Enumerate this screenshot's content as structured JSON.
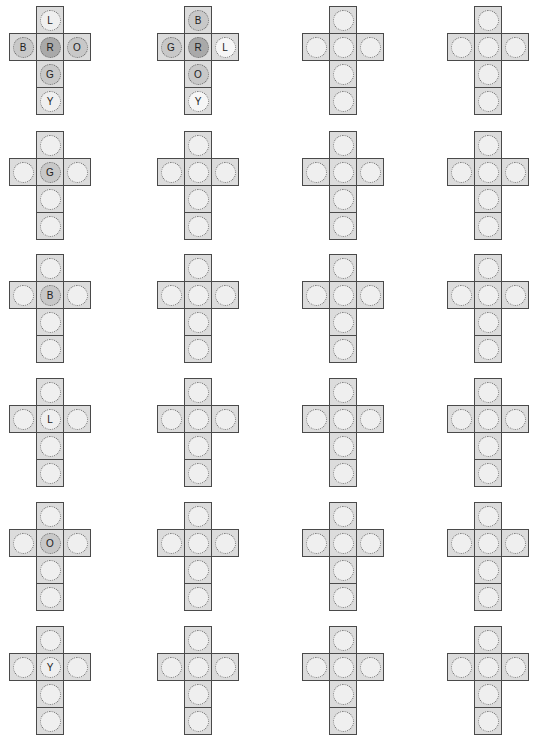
{
  "diagram": {
    "title": "",
    "type": "cube-net-grid",
    "layout": {
      "rows": 6,
      "columns": 4,
      "cell_size_px": 28
    },
    "shape_positions": {
      "cells": [
        {
          "key": "top",
          "col": 1,
          "row": 0
        },
        {
          "key": "left",
          "col": 0,
          "row": 1
        },
        {
          "key": "center",
          "col": 1,
          "row": 1
        },
        {
          "key": "right",
          "col": 2,
          "row": 1
        },
        {
          "key": "below",
          "col": 1,
          "row": 2
        },
        {
          "key": "bottom",
          "col": 1,
          "row": 3
        }
      ]
    },
    "colors": {
      "cell_fill": "#dcdcdc",
      "cell_border": "#4a4a4a",
      "circle_fill": "#efefef",
      "circle_shaded": "#a9a9a9",
      "circle_mid": "#c8c8c8"
    },
    "nets": [
      {
        "row": 0,
        "col": 0,
        "x": 9,
        "y": 6,
        "labels": {
          "top": "L",
          "left": "B",
          "center": "R",
          "right": "O",
          "below": "G",
          "bottom": "Y"
        },
        "shade": {
          "center": "dark",
          "left": "mid",
          "right": "mid",
          "below": "mid"
        }
      },
      {
        "row": 0,
        "col": 1,
        "x": 157,
        "y": 6,
        "labels": {
          "top": "B",
          "left": "G",
          "center": "R",
          "right": "L",
          "below": "O",
          "bottom": "Y"
        },
        "shade": {
          "center": "dark",
          "left": "mid",
          "top": "mid",
          "below": "mid",
          "right": "light",
          "bottom": "light"
        }
      },
      {
        "row": 0,
        "col": 2,
        "x": 302,
        "y": 6,
        "labels": {},
        "shade": {}
      },
      {
        "row": 0,
        "col": 3,
        "x": 447,
        "y": 6,
        "labels": {},
        "shade": {}
      },
      {
        "row": 1,
        "col": 0,
        "x": 9,
        "y": 131,
        "labels": {
          "center": "G"
        },
        "shade": {
          "center": "mid"
        }
      },
      {
        "row": 1,
        "col": 1,
        "x": 157,
        "y": 131,
        "labels": {},
        "shade": {}
      },
      {
        "row": 1,
        "col": 2,
        "x": 302,
        "y": 131,
        "labels": {},
        "shade": {}
      },
      {
        "row": 1,
        "col": 3,
        "x": 447,
        "y": 131,
        "labels": {},
        "shade": {}
      },
      {
        "row": 2,
        "col": 0,
        "x": 9,
        "y": 254,
        "labels": {
          "center": "B"
        },
        "shade": {
          "center": "mid"
        }
      },
      {
        "row": 2,
        "col": 1,
        "x": 157,
        "y": 254,
        "labels": {},
        "shade": {}
      },
      {
        "row": 2,
        "col": 2,
        "x": 302,
        "y": 254,
        "labels": {},
        "shade": {}
      },
      {
        "row": 2,
        "col": 3,
        "x": 447,
        "y": 254,
        "labels": {},
        "shade": {}
      },
      {
        "row": 3,
        "col": 0,
        "x": 9,
        "y": 378,
        "labels": {
          "center": "L"
        },
        "shade": {}
      },
      {
        "row": 3,
        "col": 1,
        "x": 157,
        "y": 378,
        "labels": {},
        "shade": {}
      },
      {
        "row": 3,
        "col": 2,
        "x": 302,
        "y": 378,
        "labels": {},
        "shade": {}
      },
      {
        "row": 3,
        "col": 3,
        "x": 447,
        "y": 378,
        "labels": {},
        "shade": {}
      },
      {
        "row": 4,
        "col": 0,
        "x": 9,
        "y": 502,
        "labels": {
          "center": "O"
        },
        "shade": {
          "center": "mid"
        }
      },
      {
        "row": 4,
        "col": 1,
        "x": 157,
        "y": 502,
        "labels": {},
        "shade": {}
      },
      {
        "row": 4,
        "col": 2,
        "x": 302,
        "y": 502,
        "labels": {},
        "shade": {}
      },
      {
        "row": 4,
        "col": 3,
        "x": 447,
        "y": 502,
        "labels": {},
        "shade": {}
      },
      {
        "row": 5,
        "col": 0,
        "x": 9,
        "y": 626,
        "labels": {
          "center": "Y"
        },
        "shade": {}
      },
      {
        "row": 5,
        "col": 1,
        "x": 157,
        "y": 626,
        "labels": {},
        "shade": {}
      },
      {
        "row": 5,
        "col": 2,
        "x": 302,
        "y": 626,
        "labels": {},
        "shade": {}
      },
      {
        "row": 5,
        "col": 3,
        "x": 447,
        "y": 626,
        "labels": {},
        "shade": {}
      }
    ]
  }
}
